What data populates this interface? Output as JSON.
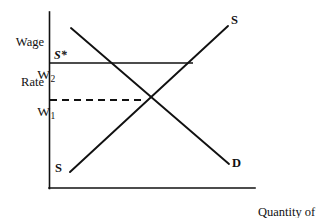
{
  "figure": {
    "type": "economics-supply-demand-diagram",
    "background_color": "#ffffff",
    "line_color": "#111111",
    "axes": {
      "y_axis_label_line1": "Wage",
      "y_axis_label_line2": "Rate",
      "x_axis_label_line1": "Quantity of",
      "x_axis_label_line2": "Labor",
      "origin": {
        "x": 49,
        "y": 188
      },
      "y_axis_top": {
        "x": 49,
        "y": 12
      },
      "x_axis_right": {
        "x": 255,
        "y": 188
      }
    },
    "ticks": [
      {
        "name": "w2",
        "label": "W",
        "subscript": "2",
        "y": 63
      },
      {
        "name": "w1",
        "label": "W",
        "subscript": "1",
        "y": 100
      }
    ],
    "curves": [
      {
        "name": "supply-curve",
        "label": "S",
        "style": "solid",
        "from": {
          "x": 70,
          "y": 172
        },
        "to": {
          "x": 228,
          "y": 26
        },
        "label_position": {
          "x": 231,
          "y": 15
        }
      },
      {
        "name": "supply-curve-lower-label",
        "label": "S",
        "style": "none",
        "label_position": {
          "x": 55,
          "y": 163
        }
      },
      {
        "name": "demand-curve",
        "label": "D",
        "style": "solid",
        "from": {
          "x": 71,
          "y": 28
        },
        "to": {
          "x": 229,
          "y": 164
        },
        "label_position": {
          "x": 232,
          "y": 158
        }
      }
    ],
    "lines": [
      {
        "name": "minimum-wage-line",
        "label": "S*",
        "style": "solid",
        "from": {
          "x": 49,
          "y": 63
        },
        "to": {
          "x": 193,
          "y": 63
        },
        "label_position": {
          "x": 54,
          "y": 50
        }
      },
      {
        "name": "equilibrium-wage-line",
        "label": "",
        "style": "dashed",
        "from": {
          "x": 49,
          "y": 100
        },
        "to": {
          "x": 146,
          "y": 100
        }
      }
    ],
    "equilibrium_point": {
      "x": 146,
      "y": 100
    }
  }
}
